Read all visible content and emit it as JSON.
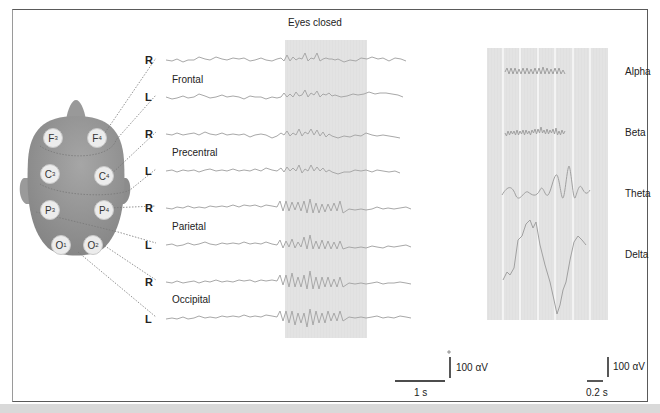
{
  "figure": {
    "title": "Eyes closed",
    "colors": {
      "trace": "#a8a8a8",
      "shade": "#e4e4e4",
      "head": "#8f8f8f",
      "electrode": "#ececec",
      "frame": "#5a5a5a",
      "text": "#222222"
    }
  },
  "regions": [
    {
      "name": "Frontal",
      "channels": [
        "R",
        "L"
      ],
      "electrodes": [
        "F3",
        "F4"
      ]
    },
    {
      "name": "Precentral",
      "channels": [
        "R",
        "L"
      ],
      "electrodes": [
        "C3",
        "C4"
      ]
    },
    {
      "name": "Parietal",
      "channels": [
        "R",
        "L"
      ],
      "electrodes": [
        "P3",
        "P4"
      ]
    },
    {
      "name": "Occipital",
      "channels": [
        "R",
        "L"
      ],
      "electrodes": [
        "O1",
        "O2"
      ]
    }
  ],
  "electrodes": {
    "F3": {
      "letter": "F",
      "sub": "3"
    },
    "F4": {
      "letter": "F",
      "sub": "4"
    },
    "C3": {
      "letter": "C",
      "sub": "3"
    },
    "C4": {
      "letter": "C",
      "sub": "4"
    },
    "P3": {
      "letter": "P",
      "sub": "3"
    },
    "P4": {
      "letter": "P",
      "sub": "4"
    },
    "O1": {
      "letter": "O",
      "sub": "1"
    },
    "O2": {
      "letter": "O",
      "sub": "2"
    }
  },
  "rhythms": [
    "Alpha",
    "Beta",
    "Theta",
    "Delta"
  ],
  "scale_left": {
    "amplitude": "100 αV",
    "time": "1 s"
  },
  "scale_right": {
    "amplitude": "100 αV",
    "time": "0.2 s"
  }
}
